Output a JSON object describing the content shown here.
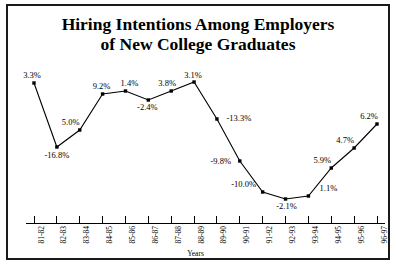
{
  "chart_data": {
    "type": "line",
    "title": "Hiring Intentions Among Employers of New College Graduates",
    "title_lines": [
      "Hiring Intentions Among Employers",
      "of New College Graduates"
    ],
    "xlabel": "Years",
    "ylabel": "",
    "legend": [],
    "grid": false,
    "categories": [
      "81-82",
      "82-83",
      "83-84",
      "84-85",
      "85-86",
      "86-87",
      "87-88",
      "88-89",
      "89-90",
      "90-91",
      "91-92",
      "92-93",
      "93-94",
      "94-95",
      "95-96",
      "96-97"
    ],
    "values": [
      3.3,
      -16.8,
      5.0,
      9.2,
      1.4,
      -2.4,
      3.8,
      3.1,
      -13.3,
      -9.8,
      -10.0,
      -2.1,
      1.1,
      5.9,
      4.7,
      6.2
    ],
    "data_labels": [
      "3.3%",
      "-16.8%",
      "5.0%",
      "9.2%",
      "1.4%",
      "-2.4%",
      "3.8%",
      "3.1%",
      "-13.3%",
      "-9.8%",
      "-10.0%",
      "-2.1%",
      "1.1%",
      "5.9%",
      "4.7%",
      "6.2%"
    ],
    "series": [
      {
        "name": "Percent change in hiring intentions",
        "marker": "square",
        "color": "#000000",
        "values": [
          3.3,
          -16.8,
          5.0,
          9.2,
          1.4,
          -2.4,
          3.8,
          3.1,
          -13.3,
          -9.8,
          -10.0,
          -2.1,
          1.1,
          5.9,
          4.7,
          6.2
        ]
      }
    ],
    "points_px": [
      {
        "x": 36,
        "y": 77,
        "label": "3.3%",
        "lx": 27,
        "ly": 64,
        "anchor": "left"
      },
      {
        "x": 62,
        "y": 141,
        "label": "-16.8%",
        "lx": 62,
        "ly": 145,
        "anchor": "center"
      },
      {
        "x": 88,
        "y": 124,
        "label": "5.0%",
        "lx": 78,
        "ly": 112,
        "anchor": "center"
      },
      {
        "x": 114,
        "y": 88,
        "label": "9.2%",
        "lx": 113,
        "ly": 76,
        "anchor": "center"
      },
      {
        "x": 140,
        "y": 85,
        "label": "1.4%",
        "lx": 144,
        "ly": 73,
        "anchor": "center"
      },
      {
        "x": 166,
        "y": 94,
        "label": "-2.4%",
        "lx": 163,
        "ly": 98,
        "anchor": "center"
      },
      {
        "x": 192,
        "y": 85,
        "label": "3.8%",
        "lx": 187,
        "ly": 74,
        "anchor": "center"
      },
      {
        "x": 218,
        "y": 76,
        "label": "3.1%",
        "lx": 216,
        "ly": 66,
        "anchor": "center"
      },
      {
        "x": 244,
        "y": 113,
        "label": "-13.3%",
        "lx": 253,
        "ly": 109,
        "anchor": "left"
      },
      {
        "x": 270,
        "y": 155,
        "label": "-9.8%",
        "lx": 252,
        "ly": 152,
        "anchor": "left"
      },
      {
        "x": 296,
        "y": 186,
        "label": "-10.0%",
        "lx": 277,
        "ly": 174,
        "anchor": "left"
      },
      {
        "x": 322,
        "y": 193,
        "label": "-2.1%",
        "lx": 306,
        "ly": 196,
        "anchor": "left"
      },
      {
        "x": 296,
        "y": 186,
        "label": "1.1%",
        "lx": 315,
        "ly": 174,
        "anchor": "left"
      },
      {
        "x": 348,
        "y": 162,
        "label": "5.9%",
        "lx": 336,
        "ly": 150,
        "anchor": "left"
      },
      {
        "x": 374,
        "y": 142,
        "label": "4.7%",
        "lx": 358,
        "ly": 131,
        "anchor": "left"
      },
      {
        "x": 400,
        "y": 118,
        "label": "6.2%",
        "lx": 386,
        "ly": 106,
        "anchor": "left"
      }
    ]
  },
  "axis": {
    "x_title": "Years",
    "tick_labels": [
      "81-82",
      "82-83",
      "83-84",
      "84-85",
      "85-86",
      "86-87",
      "87-88",
      "88-89",
      "89-90",
      "90-91",
      "91-92",
      "92-93",
      "93-94",
      "94-95",
      "95-96",
      "96-97"
    ]
  },
  "colors": {
    "frame": "#1a1a1a",
    "line": "#000000",
    "marker": "#000000",
    "background": "#ffffff",
    "text": "#000000"
  }
}
